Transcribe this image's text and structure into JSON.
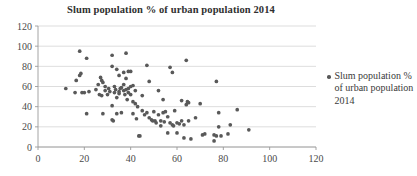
{
  "chart_data": {
    "type": "scatter",
    "title": "Slum population % of urban population 2014",
    "xlabel": "",
    "ylabel": "",
    "xlim": [
      0,
      120
    ],
    "ylim": [
      0,
      120
    ],
    "xticks": [
      0,
      20,
      40,
      60,
      80,
      100,
      120
    ],
    "yticks": [
      0,
      20,
      40,
      60,
      80,
      100,
      120
    ],
    "grid": "horizontal",
    "legend_position": "right",
    "marker_color": "#595959",
    "marker_shape": "circle",
    "series": [
      {
        "name": "Slum population % of urban population 2014",
        "points": [
          [
            12,
            58
          ],
          [
            16,
            54
          ],
          [
            16.5,
            66
          ],
          [
            18,
            95
          ],
          [
            18,
            71
          ],
          [
            18.5,
            73
          ],
          [
            19,
            54
          ],
          [
            20,
            54
          ],
          [
            21,
            88
          ],
          [
            21,
            33
          ],
          [
            22,
            55
          ],
          [
            25,
            57
          ],
          [
            26,
            62
          ],
          [
            26.5,
            52
          ],
          [
            27,
            69
          ],
          [
            27.5,
            66
          ],
          [
            27.5,
            51
          ],
          [
            28,
            64
          ],
          [
            28,
            33
          ],
          [
            29,
            60
          ],
          [
            29,
            56
          ],
          [
            30,
            52
          ],
          [
            30.5,
            58
          ],
          [
            31,
            55
          ],
          [
            32,
            91
          ],
          [
            32,
            80
          ],
          [
            32,
            41
          ],
          [
            32,
            27
          ],
          [
            32.5,
            26
          ],
          [
            33,
            60
          ],
          [
            33,
            54
          ],
          [
            33.5,
            57
          ],
          [
            34,
            77
          ],
          [
            34,
            49
          ],
          [
            34,
            33
          ],
          [
            35,
            71
          ],
          [
            35,
            55
          ],
          [
            35,
            53
          ],
          [
            35.5,
            58
          ],
          [
            36,
            59
          ],
          [
            36,
            34
          ],
          [
            37,
            74
          ],
          [
            37,
            62
          ],
          [
            37,
            56
          ],
          [
            37.5,
            52
          ],
          [
            38,
            93
          ],
          [
            38,
            68
          ],
          [
            38,
            57
          ],
          [
            38.5,
            47
          ],
          [
            39,
            75
          ],
          [
            39,
            58
          ],
          [
            39,
            54
          ],
          [
            40,
            75
          ],
          [
            40,
            60
          ],
          [
            40,
            52
          ],
          [
            41,
            61
          ],
          [
            41,
            45
          ],
          [
            41,
            33
          ],
          [
            42,
            56
          ],
          [
            42,
            43
          ],
          [
            42.5,
            28
          ],
          [
            43,
            40
          ],
          [
            43.5,
            11
          ],
          [
            44,
            11
          ],
          [
            45,
            51
          ],
          [
            45,
            36
          ],
          [
            46,
            32
          ],
          [
            47,
            81
          ],
          [
            47,
            34
          ],
          [
            48,
            65
          ],
          [
            48,
            29
          ],
          [
            49,
            27
          ],
          [
            49.5,
            26
          ],
          [
            50,
            35
          ],
          [
            50.5,
            26
          ],
          [
            51,
            24
          ],
          [
            52,
            56
          ],
          [
            52,
            32
          ],
          [
            53,
            26
          ],
          [
            53,
            21
          ],
          [
            54,
            47
          ],
          [
            54,
            34
          ],
          [
            54.5,
            25
          ],
          [
            55,
            35
          ],
          [
            56,
            30
          ],
          [
            56,
            14
          ],
          [
            57,
            79
          ],
          [
            57,
            24
          ],
          [
            58,
            74
          ],
          [
            58,
            22
          ],
          [
            58.5,
            21
          ],
          [
            59,
            36
          ],
          [
            60,
            24
          ],
          [
            60,
            14
          ],
          [
            61,
            23
          ],
          [
            62,
            46
          ],
          [
            62,
            26
          ],
          [
            63,
            9
          ],
          [
            63,
            22
          ],
          [
            64,
            86
          ],
          [
            64,
            42
          ],
          [
            64.5,
            45
          ],
          [
            65,
            44
          ],
          [
            65,
            26
          ],
          [
            66,
            8
          ],
          [
            68,
            29
          ],
          [
            70,
            43
          ],
          [
            71,
            12
          ],
          [
            72,
            13
          ],
          [
            76,
            6
          ],
          [
            76,
            12
          ],
          [
            77,
            65
          ],
          [
            77,
            11
          ],
          [
            78,
            20
          ],
          [
            78,
            34
          ],
          [
            79,
            11
          ],
          [
            82,
            13
          ],
          [
            83,
            22
          ],
          [
            86,
            37
          ],
          [
            91,
            17
          ]
        ]
      }
    ]
  },
  "legend": {
    "label": "Slum population % of urban population 2014"
  }
}
